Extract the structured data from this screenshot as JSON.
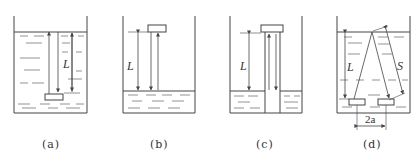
{
  "figure": {
    "panels": [
      {
        "id": "a",
        "caption": "(a)",
        "length_label": "L",
        "description": "Source submerged at bottom of liquid, beam traveling up to surface and back"
      },
      {
        "id": "b",
        "caption": "(b)",
        "length_label": "L",
        "description": "Source above liquid surface, beam traveling down to surface and back"
      },
      {
        "id": "c",
        "caption": "(c)",
        "length_label": "L",
        "description": "Source above liquid with guide tube extending into liquid"
      },
      {
        "id": "d",
        "caption": "(d)",
        "length_label": "L",
        "slant_label": "S",
        "spacing_label": "2a",
        "description": "Two transducers at bottom separated by 2a, slanted beam path S reflecting off surface"
      }
    ],
    "colors": {
      "line": "#444444",
      "fill": "#ffffff"
    }
  }
}
